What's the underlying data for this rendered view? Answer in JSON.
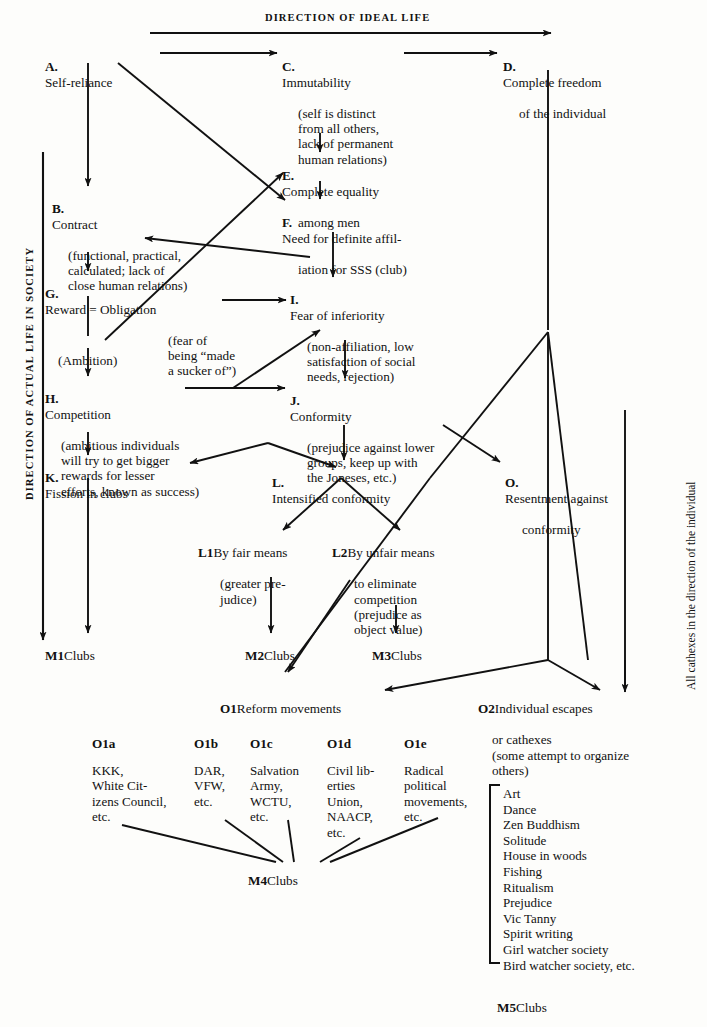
{
  "axes": {
    "top": "DIRECTION OF IDEAL LIFE",
    "left": "DIRECTION OF ACTUAL LIFE IN SOCIETY",
    "right": "All cathexes in the direction of the individual"
  },
  "nodes": {
    "A": {
      "label": "A.",
      "title": "Self-reliance",
      "detail": ""
    },
    "C": {
      "label": "C.",
      "title": "Immutability",
      "detail": "(self is distinct\nfrom all others,\nlack of permanent\nhuman relations)"
    },
    "D": {
      "label": "D.",
      "title": "Complete freedom",
      "detail": "of the individual"
    },
    "E": {
      "label": "E.",
      "title": "Complete equality",
      "detail": "among men"
    },
    "F": {
      "label": "F.",
      "title": "Need for definite affil-",
      "detail": "iation for SSS (club)"
    },
    "B": {
      "label": "B.",
      "title": "Contract",
      "detail": "(functional, practical,\ncalculated; lack of\nclose human relations)"
    },
    "G": {
      "label": "G.",
      "title": "Reward  =  Obligation",
      "detail": "(fear of\nbeing “made\na sucker of”)"
    },
    "G_sub": {
      "title": "(Ambition)"
    },
    "H": {
      "label": "H.",
      "title": "Competition",
      "detail": "(ambitious individuals\nwill try to get bigger\nrewards for lesser\nefforts, known as success)"
    },
    "I": {
      "label": "I.",
      "title": "Fear of inferiority",
      "detail": "(non-affiliation, low\nsatisfaction of social\nneeds, rejection)"
    },
    "J": {
      "label": "J.",
      "title": "Conformity",
      "detail": "(prejudice against lower\ngroups, keep up with\nthe Joneses, etc.)"
    },
    "K": {
      "label": "K.",
      "title": "Fission in clubs",
      "detail": ""
    },
    "L": {
      "label": "L.",
      "title": "Intensified conformity",
      "detail": ""
    },
    "O": {
      "label": "O.",
      "title": "Resentment against",
      "detail": "conformity"
    },
    "L1": {
      "label": "L1",
      "title": "By fair means",
      "detail": "(greater pre-\njudice)"
    },
    "L2": {
      "label": "L2",
      "title": "By unfair means",
      "detail": "to eliminate\ncompetition\n(prejudice as\nobject value)"
    },
    "M1": {
      "label": "M1",
      "title": "Clubs"
    },
    "M2": {
      "label": "M2",
      "title": "Clubs"
    },
    "M3": {
      "label": "M3",
      "title": "Clubs"
    },
    "M4": {
      "label": "M4",
      "title": "Clubs"
    },
    "M5": {
      "label": "M5",
      "title": "Clubs"
    },
    "O1": {
      "label": "O1",
      "title": "Reform movements"
    },
    "O2": {
      "label": "O2",
      "title": "Individual escapes",
      "detail": "or cathexes\n(some attempt to organize\nothers)"
    }
  },
  "reform_columns": [
    {
      "code": "O1a",
      "items": "KKK,\nWhite Cit-\nizens Council,\netc."
    },
    {
      "code": "O1b",
      "items": "DAR,\nVFW,\netc."
    },
    {
      "code": "O1c",
      "items": "Salvation\nArmy,\nWCTU,\netc."
    },
    {
      "code": "O1d",
      "items": "Civil lib-\nerties\nUnion,\nNAACP,\netc."
    },
    {
      "code": "O1e",
      "items": "Radical\npolitical\nmovements,\netc."
    }
  ],
  "escape_list": "Art\nDance\nZen Buddhism\nSolitude\nHouse in woods\nFishing\nRitualism\nPrejudice\nVic Tanny\nSpirit writing\nGirl watcher society\nBird watcher society, etc.",
  "colors": {
    "ink": "#111111",
    "paper": "#fdfdfb"
  }
}
